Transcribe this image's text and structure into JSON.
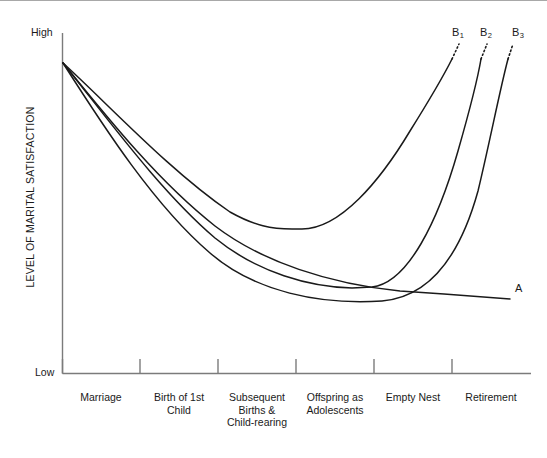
{
  "chart_data": {
    "type": "line",
    "title": "",
    "xlabel": "",
    "ylabel": "LEVEL OF MARITAL SATISFACTION",
    "y_axis_high_label": "High",
    "y_axis_low_label": "Low",
    "grid": false,
    "legend_position": "inline-end-of-curve",
    "categories": [
      "Marriage",
      "Birth of 1st Child",
      "Subsequent Births & Child-rearing",
      "Offspring as Adolescents",
      "Empty Nest",
      "Retirement"
    ],
    "series": [
      {
        "name": "A",
        "label": "A",
        "description": "Gradual continuous decline in marital satisfaction across the family life cycle",
        "x": [
          "Marriage",
          "Birth of 1st Child",
          "Subsequent Births & Child-rearing",
          "Offspring as Adolescents",
          "Empty Nest",
          "Retirement"
        ],
        "values": [
          100,
          74,
          55,
          40,
          29,
          24
        ],
        "dotted_extension": false
      },
      {
        "name": "B1",
        "label": "B",
        "sublabel": "1",
        "description": "U-shaped curve with earliest recovery, bottoming during child-rearing and rising sharply thereafter",
        "x": [
          "Marriage",
          "Birth of 1st Child",
          "Subsequent Births & Child-rearing",
          "Offspring as Adolescents",
          "Empty Nest",
          "Retirement"
        ],
        "values": [
          100,
          63,
          44,
          44,
          68,
          98
        ],
        "dotted_extension": true
      },
      {
        "name": "B2",
        "label": "B",
        "sublabel": "2",
        "description": "U-shaped curve with later minimum at offspring-as-adolescents stage and steep recovery",
        "x": [
          "Marriage",
          "Birth of 1st Child",
          "Subsequent Births & Child-rearing",
          "Offspring as Adolescents",
          "Empty Nest",
          "Retirement"
        ],
        "values": [
          100,
          56,
          36,
          30,
          33,
          92
        ],
        "dotted_extension": true
      },
      {
        "name": "B3",
        "label": "B",
        "sublabel": "3",
        "description": "U-shaped curve with the latest minimum at the empty nest stage and the steepest late rise",
        "x": [
          "Marriage",
          "Birth of 1st Child",
          "Subsequent Births & Child-rearing",
          "Offspring as Adolescents",
          "Empty Nest",
          "Retirement"
        ],
        "values": [
          100,
          50,
          30,
          23,
          21,
          88
        ],
        "dotted_extension": true
      }
    ],
    "ylim": [
      0,
      100
    ]
  },
  "curve_labels": {
    "a": "A",
    "b1_base": "B",
    "b1_sub": "1",
    "b2_base": "B",
    "b2_sub": "2",
    "b3_base": "B",
    "b3_sub": "3"
  },
  "axis": {
    "y_title": "LEVEL OF MARITAL SATISFACTION",
    "high": "High",
    "low": "Low"
  },
  "x_categories": [
    "Marriage",
    "Birth of 1st\nChild",
    "Subsequent\nBirths &\nChild-rearing",
    "Offspring as\nAdolescents",
    "Empty Nest",
    "Retirement"
  ],
  "x_category_lines": {
    "c0": [
      "Marriage"
    ],
    "c1": [
      "Birth of 1st",
      "Child"
    ],
    "c2": [
      "Subsequent",
      "Births &",
      "Child-rearing"
    ],
    "c3": [
      "Offspring as",
      "Adolescents"
    ],
    "c4": [
      "Empty Nest"
    ],
    "c5": [
      "Retirement"
    ]
  },
  "colors": {
    "curve": "#1a1a1a",
    "axis": "#7b7b7b",
    "background": "#ffffff",
    "border": "#a8a8a8"
  }
}
